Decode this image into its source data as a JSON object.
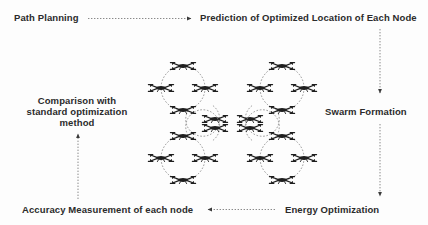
{
  "figure": {
    "background_color": "#fdfdfd",
    "text_color": "#2b2b2b",
    "line_color": "#8a8a8a",
    "arrow_color": "#3a3a3a",
    "drone_color": "#1e1e1e"
  },
  "nodes": {
    "path_planning": "Path Planning",
    "prediction": "Prediction of Optimized Location of Each Node",
    "swarm_formation": "Swarm Formation",
    "energy_optimization": "Energy Optimization",
    "accuracy_measurement": "Accuracy Measurement of each node",
    "comparison": "Comparison with standard optimization method"
  },
  "connectors": [
    {
      "name": "path-planning-to-prediction",
      "direction": "right",
      "style": "dotted"
    },
    {
      "name": "prediction-to-swarm-formation",
      "direction": "down",
      "style": "dotted"
    },
    {
      "name": "swarm-formation-to-energy-optimization",
      "direction": "down",
      "style": "dotted"
    },
    {
      "name": "energy-optimization-to-accuracy-measurement",
      "direction": "left",
      "style": "dotted"
    },
    {
      "name": "accuracy-measurement-to-comparison",
      "direction": "up",
      "style": "dotted"
    }
  ],
  "swarm_clusters": [
    {
      "name": "cluster-top-left",
      "cx": 183,
      "cy": 88,
      "r": 22,
      "satellite_dir": "down-right"
    },
    {
      "name": "cluster-top-right",
      "cx": 282,
      "cy": 88,
      "r": 22,
      "satellite_dir": "down-left"
    },
    {
      "name": "cluster-bottom-left",
      "cx": 183,
      "cy": 158,
      "r": 22,
      "satellite_dir": "up-right"
    },
    {
      "name": "cluster-bottom-right",
      "cx": 282,
      "cy": 158,
      "r": 22,
      "satellite_dir": "up-left"
    }
  ]
}
